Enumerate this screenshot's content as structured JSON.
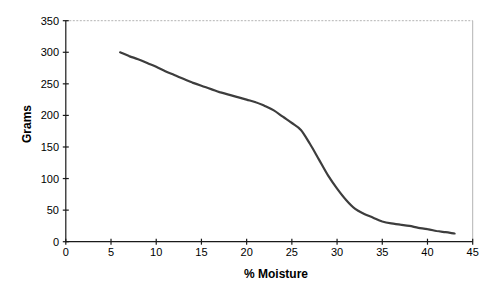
{
  "chart_data": {
    "type": "line",
    "title": "",
    "xlabel": "% Moisture",
    "ylabel": "Grams",
    "xlim": [
      0,
      45
    ],
    "ylim": [
      0,
      350
    ],
    "x_ticks": [
      0,
      5,
      10,
      15,
      20,
      25,
      30,
      35,
      40,
      45
    ],
    "y_ticks": [
      0,
      50,
      100,
      150,
      200,
      250,
      300,
      350
    ],
    "grid": "off",
    "legend": "none",
    "markers": "none",
    "series": [
      {
        "name": "weight-vs-moisture",
        "points": [
          [
            6,
            300
          ],
          [
            7,
            294
          ],
          [
            8,
            289
          ],
          [
            9,
            283
          ],
          [
            10,
            277
          ],
          [
            11,
            270
          ],
          [
            12,
            264
          ],
          [
            13,
            258
          ],
          [
            14,
            252
          ],
          [
            15,
            247
          ],
          [
            16,
            242
          ],
          [
            17,
            237
          ],
          [
            18,
            233
          ],
          [
            19,
            229
          ],
          [
            20,
            225
          ],
          [
            21,
            221
          ],
          [
            22,
            215
          ],
          [
            23,
            208
          ],
          [
            24,
            198
          ],
          [
            25,
            188
          ],
          [
            26,
            177
          ],
          [
            27,
            155
          ],
          [
            28,
            130
          ],
          [
            29,
            105
          ],
          [
            30,
            84
          ],
          [
            31,
            66
          ],
          [
            32,
            52
          ],
          [
            33,
            44
          ],
          [
            34,
            38
          ],
          [
            35,
            32
          ],
          [
            36,
            29
          ],
          [
            37,
            27
          ],
          [
            38,
            25
          ],
          [
            39,
            22
          ],
          [
            40,
            20
          ],
          [
            41,
            17
          ],
          [
            42,
            15
          ],
          [
            43,
            13
          ]
        ]
      }
    ]
  },
  "style": {
    "line_color": "#3d3d3d",
    "axis_color": "#1a1a1a",
    "plot_border_color": "#b3b3b3",
    "background": "#ffffff",
    "text_color": "#000000"
  }
}
